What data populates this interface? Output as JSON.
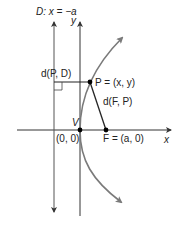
{
  "diagram": {
    "labels": {
      "directrix": "D: x = −a",
      "y_axis": "y",
      "x_axis": "x",
      "dist_pd": "d(P, D)",
      "point_p": "P = (x, y)",
      "dist_fp": "d(F, P)",
      "vertex": "V",
      "origin": "(0, 0)",
      "focus": "F = (a, 0)"
    },
    "colors": {
      "axis": "#333333",
      "curve": "#7a7a7a",
      "point": "#000000",
      "text": "#222222"
    }
  }
}
